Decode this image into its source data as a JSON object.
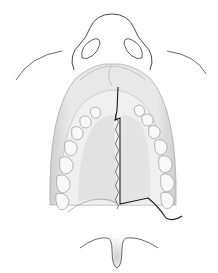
{
  "illustration": {
    "subject": "palate-anatomy",
    "colors": {
      "background": "#ffffff",
      "outline": "#2a2a2a",
      "gum": "#d9d9d9",
      "gum_light": "#ececec",
      "palate": "#e6e6e6",
      "tooth": "#f7f7f7",
      "incision": "#1a1a1a"
    }
  }
}
